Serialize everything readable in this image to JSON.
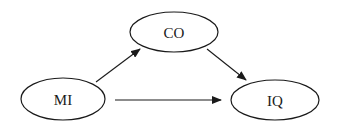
{
  "diagram": {
    "type": "path-diagram",
    "colors": {
      "stroke": "#1a1a1a",
      "fill": "#ffffff",
      "background": "#ffffff"
    },
    "nodes": [
      {
        "id": "CO",
        "label": "CO",
        "cx": 174,
        "cy": 32,
        "rx": 44,
        "ry": 20
      },
      {
        "id": "MI",
        "label": "MI",
        "cx": 63,
        "cy": 99,
        "rx": 42,
        "ry": 21
      },
      {
        "id": "IQ",
        "label": "IQ",
        "cx": 275,
        "cy": 100,
        "rx": 44,
        "ry": 20
      }
    ],
    "edges": [
      {
        "from": "MI",
        "to": "CO",
        "x1": 96,
        "y1": 82,
        "x2": 140,
        "y2": 49
      },
      {
        "from": "CO",
        "to": "IQ",
        "x1": 207,
        "y1": 49,
        "x2": 246,
        "y2": 80
      },
      {
        "from": "MI",
        "to": "IQ",
        "x1": 115,
        "y1": 100,
        "x2": 221,
        "y2": 100
      }
    ]
  }
}
